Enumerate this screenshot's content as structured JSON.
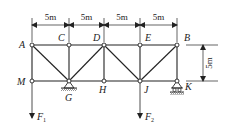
{
  "diagram": {
    "type": "truss",
    "nodes": {
      "A": {
        "label": "A",
        "x": 32,
        "y": 45
      },
      "C": {
        "label": "C",
        "x": 69,
        "y": 45
      },
      "D": {
        "label": "D",
        "x": 104,
        "y": 45
      },
      "E": {
        "label": "E",
        "x": 140,
        "y": 45
      },
      "B": {
        "label": "B",
        "x": 177,
        "y": 45
      },
      "M": {
        "label": "M",
        "x": 32,
        "y": 81
      },
      "G": {
        "label": "G",
        "x": 69,
        "y": 81
      },
      "H": {
        "label": "H",
        "x": 104,
        "y": 81
      },
      "J": {
        "label": "J",
        "x": 140,
        "y": 81
      },
      "K": {
        "label": "K",
        "x": 177,
        "y": 81
      }
    },
    "members": [
      [
        "A",
        "C"
      ],
      [
        "C",
        "D"
      ],
      [
        "D",
        "E"
      ],
      [
        "E",
        "B"
      ],
      [
        "M",
        "G"
      ],
      [
        "G",
        "H"
      ],
      [
        "H",
        "J"
      ],
      [
        "J",
        "K"
      ],
      [
        "A",
        "M"
      ],
      [
        "C",
        "G"
      ],
      [
        "D",
        "H"
      ],
      [
        "E",
        "J"
      ],
      [
        "B",
        "K"
      ],
      [
        "A",
        "G"
      ],
      [
        "G",
        "D"
      ],
      [
        "D",
        "J"
      ],
      [
        "J",
        "B"
      ]
    ],
    "dimensions": {
      "top": [
        "5m",
        "5m",
        "5m",
        "5m"
      ],
      "right": "5m"
    },
    "supports": {
      "G": "pinned",
      "K": "roller"
    },
    "loads": {
      "F1": {
        "label": "F",
        "sub": "1",
        "node": "M"
      },
      "F2": {
        "label": "F",
        "sub": "2",
        "node": "J"
      }
    },
    "colors": {
      "line": "#222222",
      "node_fill": "#ffffff"
    }
  }
}
